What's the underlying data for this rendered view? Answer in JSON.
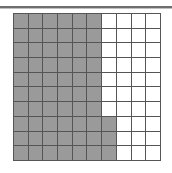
{
  "figure": {
    "kind": "shaded-square-grid",
    "title": "",
    "caption": "",
    "top_rule_present": true
  },
  "grid": {
    "rows": 10,
    "columns": 10,
    "total_cells": 100,
    "shaded_cells": 63,
    "unshaded_cells": 37,
    "shaded_fraction": "63/100",
    "shaded_percent": "63%",
    "shaded_color": "#9a9a9a",
    "unshaded_color": "#ffffff",
    "gridline_color": "#555555",
    "border_color": "#555555",
    "shaded_per_row": [
      6,
      6,
      6,
      6,
      6,
      6,
      6,
      7,
      7,
      7
    ],
    "cells": [
      [
        1,
        1,
        1,
        1,
        1,
        1,
        0,
        0,
        0,
        0
      ],
      [
        1,
        1,
        1,
        1,
        1,
        1,
        0,
        0,
        0,
        0
      ],
      [
        1,
        1,
        1,
        1,
        1,
        1,
        0,
        0,
        0,
        0
      ],
      [
        1,
        1,
        1,
        1,
        1,
        1,
        0,
        0,
        0,
        0
      ],
      [
        1,
        1,
        1,
        1,
        1,
        1,
        0,
        0,
        0,
        0
      ],
      [
        1,
        1,
        1,
        1,
        1,
        1,
        0,
        0,
        0,
        0
      ],
      [
        1,
        1,
        1,
        1,
        1,
        1,
        0,
        0,
        0,
        0
      ],
      [
        1,
        1,
        1,
        1,
        1,
        1,
        1,
        0,
        0,
        0
      ],
      [
        1,
        1,
        1,
        1,
        1,
        1,
        1,
        0,
        0,
        0
      ],
      [
        1,
        1,
        1,
        1,
        1,
        1,
        1,
        0,
        0,
        0
      ]
    ]
  },
  "chart_data": {
    "type": "heatmap",
    "title": "",
    "xlabel": "",
    "ylabel": "",
    "rows": 10,
    "columns": 10,
    "legend": [],
    "values": [
      [
        1,
        1,
        1,
        1,
        1,
        1,
        0,
        0,
        0,
        0
      ],
      [
        1,
        1,
        1,
        1,
        1,
        1,
        0,
        0,
        0,
        0
      ],
      [
        1,
        1,
        1,
        1,
        1,
        1,
        0,
        0,
        0,
        0
      ],
      [
        1,
        1,
        1,
        1,
        1,
        1,
        0,
        0,
        0,
        0
      ],
      [
        1,
        1,
        1,
        1,
        1,
        1,
        0,
        0,
        0,
        0
      ],
      [
        1,
        1,
        1,
        1,
        1,
        1,
        0,
        0,
        0,
        0
      ],
      [
        1,
        1,
        1,
        1,
        1,
        1,
        0,
        0,
        0,
        0
      ],
      [
        1,
        1,
        1,
        1,
        1,
        1,
        1,
        0,
        0,
        0
      ],
      [
        1,
        1,
        1,
        1,
        1,
        1,
        1,
        0,
        0,
        0
      ],
      [
        1,
        1,
        1,
        1,
        1,
        1,
        1,
        0,
        0,
        0
      ]
    ]
  }
}
